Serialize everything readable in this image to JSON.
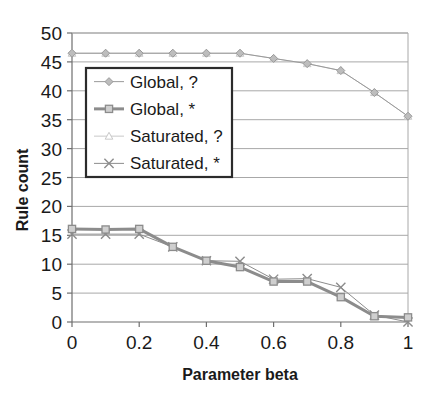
{
  "chart_data": {
    "type": "line",
    "title": "",
    "xlabel": "Parameter beta",
    "ylabel": "Rule count",
    "xlim": [
      0,
      1
    ],
    "ylim": [
      0,
      50
    ],
    "xticks": [
      "0",
      "0.2",
      "0.4",
      "0.6",
      "0.8",
      "1"
    ],
    "xtick_values": [
      0,
      0.2,
      0.4,
      0.6,
      0.8,
      1
    ],
    "yticks": [
      "0",
      "5",
      "10",
      "15",
      "20",
      "25",
      "30",
      "35",
      "40",
      "45",
      "50"
    ],
    "ytick_values": [
      0,
      5,
      10,
      15,
      20,
      25,
      30,
      35,
      40,
      45,
      50
    ],
    "grid": true,
    "grid_axis": "y",
    "legend_position": "upper-left-inside",
    "x": [
      0,
      0.1,
      0.2,
      0.3,
      0.4,
      0.5,
      0.6,
      0.7,
      0.8,
      0.9,
      1.0
    ],
    "series": [
      {
        "name": "Global, ?",
        "marker": "diamond",
        "color": "#9a9a9a",
        "linewidth": 1,
        "values": [
          46.5,
          46.5,
          46.5,
          46.5,
          46.5,
          46.5,
          45.6,
          44.7,
          43.5,
          39.7,
          35.6
        ]
      },
      {
        "name": "Global, *",
        "marker": "square",
        "color": "#8c8c8c",
        "linewidth": 3,
        "values": [
          16.1,
          16.0,
          16.1,
          13.0,
          10.6,
          9.5,
          7.0,
          7.0,
          4.3,
          1.0,
          0.8
        ]
      },
      {
        "name": "Saturated, ?",
        "marker": "triangle",
        "color": "#c8c8c8",
        "linewidth": 1,
        "values": [
          46.5,
          46.5,
          46.5,
          46.5,
          46.5,
          46.5,
          45.6,
          44.7,
          43.5,
          39.7,
          35.6
        ]
      },
      {
        "name": "Saturated, *",
        "marker": "cross",
        "color": "#8c8c8c",
        "linewidth": 1,
        "values": [
          15.2,
          15.2,
          15.2,
          13.0,
          10.6,
          10.5,
          7.4,
          7.5,
          6.0,
          1.2,
          0.0
        ]
      }
    ]
  },
  "legend": {
    "items": [
      {
        "label": "Global, ?"
      },
      {
        "label": "Global, *"
      },
      {
        "label": "Saturated, ?"
      },
      {
        "label": "Saturated, *"
      }
    ]
  },
  "axes": {
    "x_title": "Parameter beta",
    "y_title": "Rule count",
    "x_tick_labels": [
      "0",
      "0.2",
      "0.4",
      "0.6",
      "0.8",
      "1"
    ],
    "y_tick_labels": [
      "0",
      "5",
      "10",
      "15",
      "20",
      "25",
      "30",
      "35",
      "40",
      "45",
      "50"
    ]
  },
  "colors": {
    "axis": "#6e6e6e",
    "grid": "#a8a8a8",
    "text": "#1a1a1a",
    "legend_border": "#2b2b2b",
    "background": "#ffffff"
  }
}
